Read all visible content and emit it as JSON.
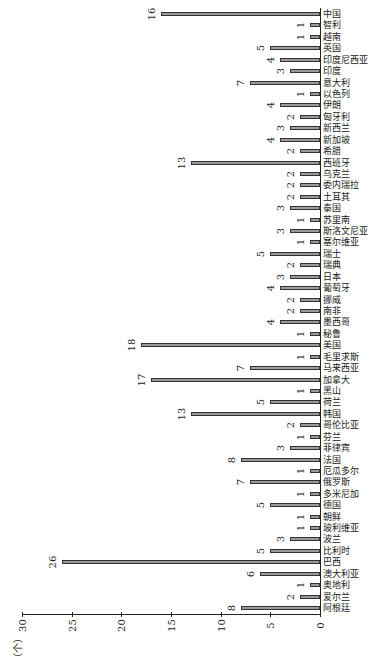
{
  "chart_data": {
    "type": "bar",
    "orientation": "rotated 90° (bars extend leftward, category labels vertical at right)",
    "title": "",
    "xlabel": "",
    "ylabel": "（个）",
    "ylim": [
      0,
      30
    ],
    "yticks": [
      0,
      5,
      10,
      15,
      20,
      25,
      30
    ],
    "grid": false,
    "data_labels": true,
    "categories": [
      "阿根廷",
      "爱尔兰",
      "奥地利",
      "澳大利亚",
      "巴西",
      "比利时",
      "波兰",
      "玻利维亚",
      "朝鲜",
      "德国",
      "多米尼加",
      "俄罗斯",
      "厄瓜多尔",
      "法国",
      "菲律宾",
      "芬兰",
      "哥伦比亚",
      "韩国",
      "荷兰",
      "黑山",
      "加拿大",
      "马来西亚",
      "毛里求斯",
      "美国",
      "秘鲁",
      "墨西哥",
      "南非",
      "挪威",
      "葡萄牙",
      "日本",
      "瑞典",
      "瑞士",
      "塞尔维亚",
      "斯洛文尼亚",
      "苏里南",
      "泰国",
      "土耳其",
      "委内瑞拉",
      "乌克兰",
      "西班牙",
      "希腊",
      "新加坡",
      "新西兰",
      "匈牙利",
      "伊朗",
      "以色列",
      "意大利",
      "印度",
      "印度尼西亚",
      "英国",
      "越南",
      "智利",
      "中国"
    ],
    "values": [
      8,
      2,
      1,
      6,
      26,
      5,
      3,
      1,
      1,
      5,
      1,
      7,
      1,
      8,
      3,
      1,
      2,
      13,
      5,
      1,
      17,
      7,
      1,
      18,
      1,
      4,
      2,
      2,
      4,
      3,
      2,
      5,
      1,
      3,
      1,
      3,
      2,
      2,
      2,
      13,
      2,
      4,
      3,
      2,
      4,
      1,
      7,
      3,
      4,
      5,
      1,
      1,
      16
    ]
  },
  "axis": {
    "unit_label": "（个）",
    "tick_labels": [
      "0",
      "5",
      "10",
      "15",
      "20",
      "25",
      "30"
    ]
  }
}
